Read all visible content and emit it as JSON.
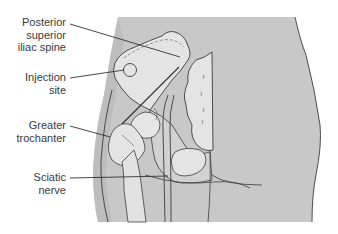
{
  "diagram": {
    "type": "anatomical-illustration",
    "labels": [
      {
        "id": "psis",
        "text_lines": [
          "Posterior",
          "superior",
          "iliac spine"
        ]
      },
      {
        "id": "injection-site",
        "text_lines": [
          "Injection",
          "site"
        ]
      },
      {
        "id": "greater-trochanter",
        "text_lines": [
          "Greater",
          "trochanter"
        ]
      },
      {
        "id": "sciatic-nerve",
        "text_lines": [
          "Sciatic",
          "nerve"
        ]
      }
    ],
    "colors": {
      "skin": "#c9c9c9",
      "bone": "#e6e6e6",
      "shadow": "#b4b4b4",
      "outline": "#3c3c3c",
      "background": "#ffffff"
    }
  }
}
